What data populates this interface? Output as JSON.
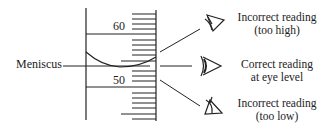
{
  "diagram": {
    "type": "graduated-cylinder-meniscus-reading",
    "scale": {
      "upper_label": "60",
      "lower_label": "50"
    },
    "meniscus_label": "Meniscus",
    "viewpoints": [
      {
        "line1": "Incorrect reading",
        "line2": "(too high)",
        "icon": "eye-looking-down-icon"
      },
      {
        "line1": "Correct reading",
        "line2": "at eye level",
        "icon": "eye-level-icon"
      },
      {
        "line1": "Incorrect reading",
        "line2": "(too low)",
        "icon": "eye-looking-up-icon"
      }
    ],
    "colors": {
      "ink": "#222222",
      "background": "#ffffff"
    }
  }
}
